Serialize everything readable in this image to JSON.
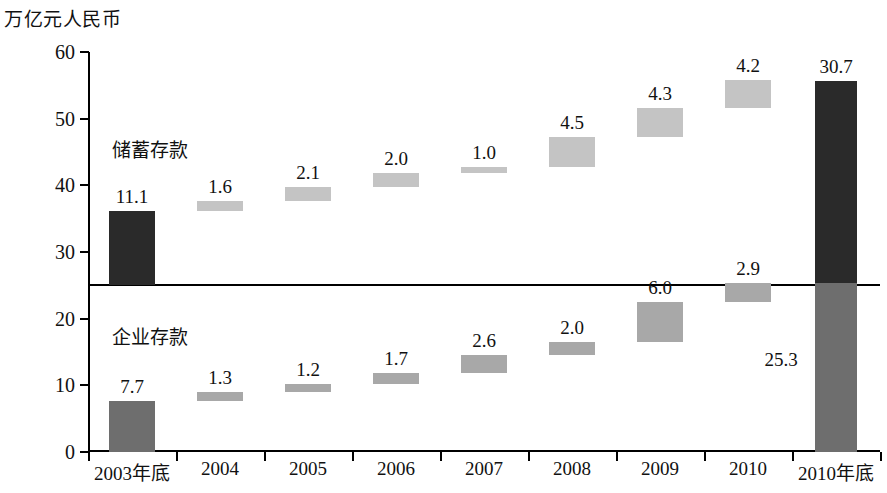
{
  "axis_unit_label": "万亿元人民币",
  "series_labels": {
    "upper": "储蓄存款",
    "lower": "企业存款"
  },
  "colors": {
    "dark": "#2a2a2a",
    "mid": "#6e6e6e",
    "light": "#c4c4c4",
    "lightmid": "#a8a8a8",
    "axis": "#000000",
    "text": "#111111"
  },
  "chart_data": {
    "type": "bar",
    "title": "",
    "subtitle": "",
    "xlabel": "",
    "ylabel": "万亿元人民币",
    "ylim": [
      0,
      60
    ],
    "ytick_labels": [
      "0",
      "10",
      "20",
      "30",
      "40",
      "50",
      "60"
    ],
    "ytick_values": [
      0,
      10,
      20,
      30,
      40,
      50,
      60
    ],
    "grid": false,
    "legend_position": "inside-plot",
    "divider_value": 25,
    "categories": [
      "2003年底",
      "2004",
      "2005",
      "2006",
      "2007",
      "2008",
      "2009",
      "2010",
      "2010年底"
    ],
    "series": [
      {
        "name": "储蓄存款",
        "kind": "upper-waterfall",
        "values": [
          11.1,
          1.6,
          2.1,
          2.0,
          1.0,
          4.5,
          4.3,
          4.2,
          30.7
        ],
        "labels": [
          "11.1",
          "1.6",
          "2.1",
          "2.0",
          "1.0",
          "4.5",
          "4.3",
          "4.2",
          "30.7"
        ],
        "bar_bottoms": [
          25.0,
          36.1,
          37.7,
          39.8,
          41.8,
          42.8,
          47.3,
          51.6,
          25.0
        ],
        "bar_tops": [
          36.1,
          37.7,
          39.8,
          41.8,
          42.8,
          47.3,
          51.6,
          55.8,
          55.7
        ],
        "shades": [
          "dark",
          "light",
          "light",
          "light",
          "light",
          "light",
          "light",
          "light",
          "dark"
        ]
      },
      {
        "name": "企业存款",
        "kind": "lower-waterfall",
        "values": [
          7.7,
          1.3,
          1.2,
          1.7,
          2.6,
          2.0,
          6.0,
          2.9,
          25.3
        ],
        "labels": [
          "7.7",
          "1.3",
          "1.2",
          "1.7",
          "2.6",
          "2.0",
          "6.0",
          "2.9",
          "25.3"
        ],
        "bar_bottoms": [
          0.0,
          7.7,
          9.0,
          10.2,
          11.9,
          14.5,
          16.5,
          22.5,
          0.0
        ],
        "bar_tops": [
          7.7,
          9.0,
          10.2,
          11.9,
          14.5,
          16.5,
          22.5,
          25.4,
          25.3
        ],
        "shades": [
          "mid",
          "lightmid",
          "lightmid",
          "lightmid",
          "lightmid",
          "lightmid",
          "lightmid",
          "lightmid",
          "mid"
        ]
      }
    ],
    "annotations": [
      {
        "text": "25.3",
        "note": "value label placed to the left of the final lower bar"
      }
    ]
  }
}
